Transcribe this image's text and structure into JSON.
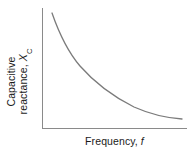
{
  "figure": {
    "background_color": "#ffffff",
    "width": 195,
    "height": 157
  },
  "axes": {
    "color": "#8a8a8a",
    "line_width": 1,
    "x_axis": {
      "x_start": 42,
      "x_end": 187,
      "y": 128
    },
    "y_axis": {
      "x": 42,
      "y_start": 8,
      "y_end": 128
    }
  },
  "labels": {
    "y_line1": "Capacitive",
    "y_line2_prefix": "reactance, ",
    "y_line2_symbol": "X",
    "y_line2_subscript": "C",
    "x_prefix": "Frequency, ",
    "x_symbol": "f",
    "text_color": "#1a1a1a"
  },
  "curve": {
    "color": "#7b7b7b",
    "width": 1.3,
    "path": "M 52 13 C 60 36, 68 52, 80 66 C 94 82, 112 96, 134 107 C 152 115, 168 118, 182 119"
  },
  "chart_data": {
    "type": "line",
    "title": "",
    "subtitle": "",
    "xlabel": "Frequency, f",
    "ylabel": "Capacitive reactance, X_C",
    "relationship": "inverse",
    "equation": "X_C = 1 / (2πfC)",
    "grid": false,
    "legend": null,
    "x_tick_labels": [],
    "y_tick_labels": [],
    "xlim": [
      0,
      1
    ],
    "ylim": [
      0,
      1
    ],
    "series": [
      {
        "name": "Capacitive reactance",
        "color": "#7b7b7b",
        "x": [
          0.07,
          0.12,
          0.19,
          0.26,
          0.33,
          0.4,
          0.47,
          0.55,
          0.64,
          0.72,
          0.81,
          0.9,
          0.97
        ],
        "y": [
          0.96,
          0.79,
          0.63,
          0.52,
          0.44,
          0.37,
          0.31,
          0.26,
          0.21,
          0.17,
          0.13,
          0.1,
          0.08
        ]
      }
    ],
    "annotations": []
  }
}
